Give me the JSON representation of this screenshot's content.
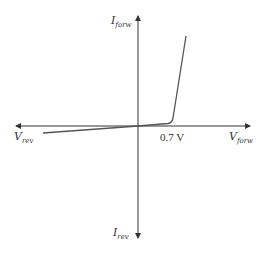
{
  "diagram": {
    "type": "diode I-V characteristic",
    "axes": {
      "y_positive": {
        "main": "I",
        "sub": "forw"
      },
      "y_negative": {
        "main": "I",
        "sub": "rev"
      },
      "x_positive": {
        "main": "V",
        "sub": "forw"
      },
      "x_negative": {
        "main": "V",
        "sub": "rev"
      }
    },
    "annotations": {
      "knee_voltage": "0.7 V"
    },
    "colors": {
      "axis": "#333333",
      "curve": "#555555"
    }
  }
}
